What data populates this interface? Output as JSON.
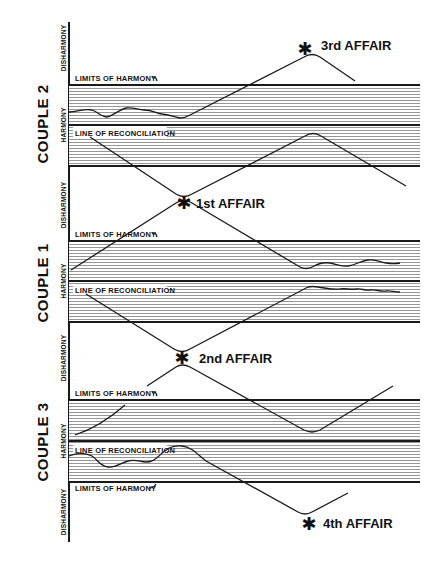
{
  "diagram": {
    "couples": [
      {
        "id": "couple-2",
        "label": "COUPLE 2",
        "zones": {
          "upper": "DISHARMONY",
          "middle": "HARMONY",
          "lower": "DISHARMONY"
        },
        "band_labels": {
          "upper_limit": "LIMITS OF HARMONY",
          "reconciliation": "LINE OF RECONCILIATION"
        },
        "affairs": [
          "3rd AFFAIR"
        ]
      },
      {
        "id": "couple-1",
        "label": "COUPLE 1",
        "zones": {
          "upper": "DISHARMONY",
          "middle": "HARMONY",
          "lower": "DISHARMONY"
        },
        "band_labels": {
          "upper_limit": "LIMITS OF HARMONY",
          "reconciliation": "LINE OF RECONCILIATION"
        },
        "affairs": [
          "1st AFFAIR",
          "2nd AFFAIR"
        ]
      },
      {
        "id": "couple-3",
        "label": "COUPLE 3",
        "zones": {
          "upper": "DISHARMONY",
          "middle": "HARMONY",
          "lower": "DISHARMONY"
        },
        "band_labels": {
          "upper_limit": "LIMITS OF HARMONY",
          "reconciliation": "LINE OF RECONCILIATION",
          "lower_limit": "LIMITS OF HARMONY"
        },
        "affairs": [
          "4th AFFAIR"
        ]
      }
    ],
    "affair_marker": "✱",
    "colors": {
      "ink": "#1a1a1a",
      "hatch": "#8a8a8a",
      "background": "#ffffff"
    }
  }
}
